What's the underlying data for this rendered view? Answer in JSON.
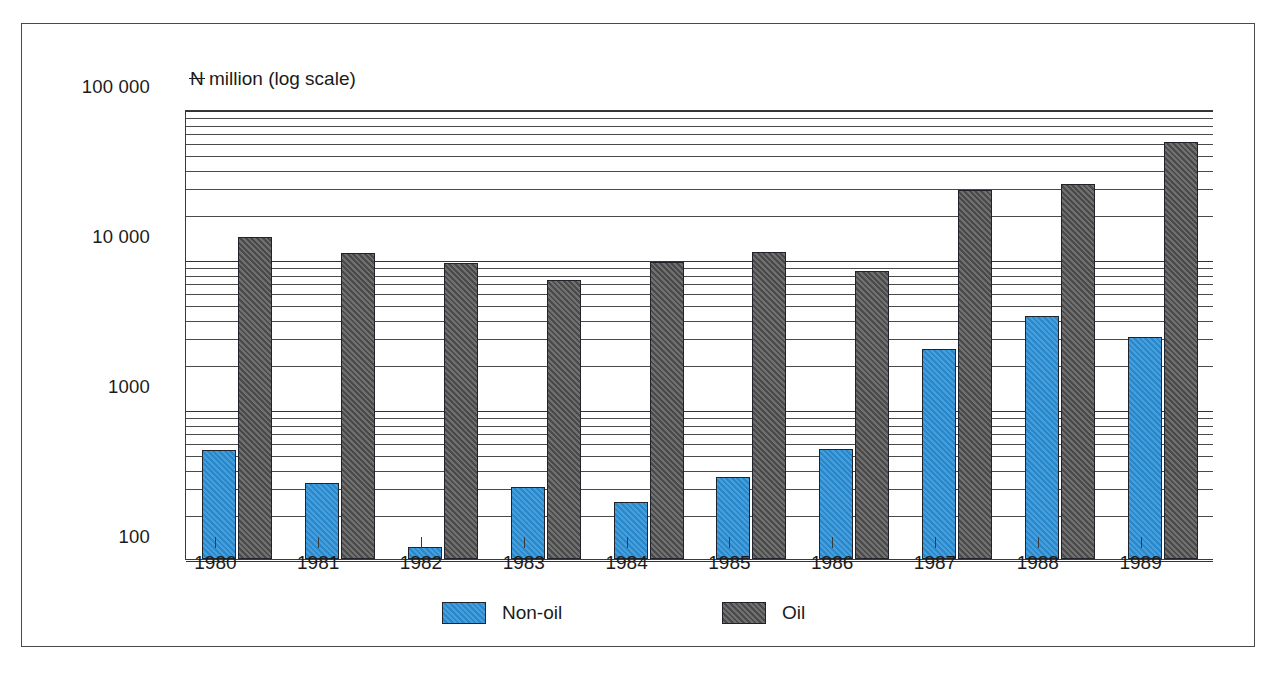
{
  "chart_data": {
    "type": "bar",
    "title": "",
    "subtitle": "",
    "ylabel": "₦ million (log scale)",
    "ylabel_parts": {
      "currency": "N",
      "rest": " million (log scale)"
    },
    "xlabel": "",
    "categories": [
      "1980",
      "1981",
      "1982",
      "1983",
      "1984",
      "1985",
      "1986",
      "1987",
      "1988",
      "1989"
    ],
    "yscale": "log",
    "ylim": [
      100,
      100000
    ],
    "ytick_labels": [
      "100 000",
      "10 000",
      "1000",
      "100"
    ],
    "ytick_values": [
      100000,
      10000,
      1000,
      100
    ],
    "grid": "minor-log-gridlines-horizontal",
    "legend_position": "bottom-center",
    "series": [
      {
        "name": "Non-oil",
        "color": "#2a90d6",
        "values": [
          530,
          320,
          120,
          300,
          240,
          350,
          540,
          2500,
          4200,
          3000
        ]
      },
      {
        "name": "Oil",
        "color": "#585858",
        "values": [
          14000,
          11000,
          9400,
          7300,
          9500,
          11200,
          8300,
          29000,
          31500,
          60000
        ]
      }
    ]
  },
  "legend": {
    "items": [
      {
        "label": "Non-oil",
        "swatch": "nonoil"
      },
      {
        "label": "Oil",
        "swatch": "oil"
      }
    ]
  }
}
